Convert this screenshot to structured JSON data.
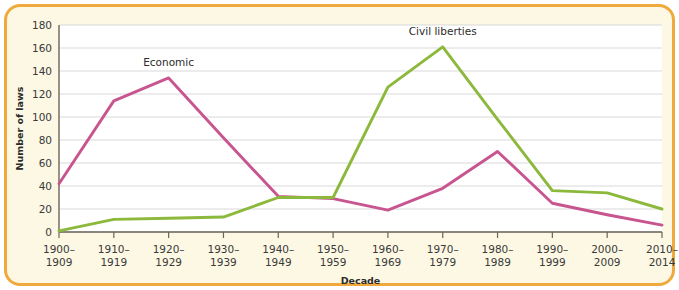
{
  "figure": {
    "border_color": "#f0a93c",
    "background_color": "#fcf8e3"
  },
  "chart_data": {
    "type": "line",
    "title": "",
    "xlabel": "Decade",
    "ylabel": "Number of laws",
    "ylim": [
      0,
      180
    ],
    "ytick_step": 20,
    "yticks": [
      "0",
      "20",
      "40",
      "60",
      "80",
      "100",
      "120",
      "140",
      "160",
      "180"
    ],
    "grid": true,
    "legend_position": "inline-labels",
    "categories": [
      "1900–\n1909",
      "1910–\n1919",
      "1920–\n1929",
      "1930–\n1939",
      "1940–\n1949",
      "1950–\n1959",
      "1960–\n1969",
      "1970–\n1979",
      "1980–\n1989",
      "1990–\n1999",
      "2000–\n2009",
      "2010–\n2014"
    ],
    "categories_line1": [
      "1900–",
      "1910–",
      "1920–",
      "1930–",
      "1940–",
      "1950–",
      "1960–",
      "1970–",
      "1980–",
      "1990–",
      "2000–",
      "2010–"
    ],
    "categories_line2": [
      "1909",
      "1919",
      "1929",
      "1939",
      "1949",
      "1959",
      "1969",
      "1979",
      "1989",
      "1999",
      "2009",
      "2014"
    ],
    "series": [
      {
        "name": "Economic",
        "color": "#c8558f",
        "label_x_index": 2,
        "values": [
          42,
          114,
          134,
          82,
          31,
          29,
          19,
          38,
          70,
          25,
          15,
          6
        ]
      },
      {
        "name": "Civil liberties",
        "color": "#8cb93c",
        "label_x_index": 7,
        "values": [
          1,
          11,
          12,
          13,
          30,
          30,
          126,
          161,
          98,
          36,
          34,
          20
        ]
      }
    ]
  },
  "annotations": [
    {
      "name": "economic-series-label",
      "text": "Economic"
    },
    {
      "name": "civil-liberties-series-label",
      "text": "Civil liberties"
    }
  ]
}
